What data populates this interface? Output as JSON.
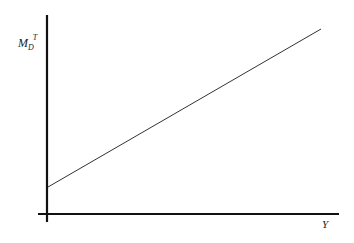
{
  "diagram": {
    "y_axis_label": {
      "main": "M",
      "sub": "D",
      "sup": "T"
    },
    "x_axis_label": "Y",
    "line": {
      "description": "upward-sloping line with positive intercept",
      "start": [
        48,
        187
      ],
      "end": [
        321,
        29
      ]
    },
    "colors": {
      "axis": "#111111",
      "line": "#333333"
    }
  }
}
